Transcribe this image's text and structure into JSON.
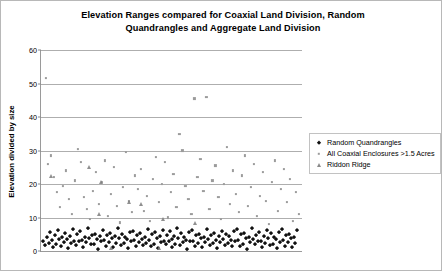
{
  "chart_data": {
    "type": "scatter",
    "title": "Elevation Ranges compared for Coaxial Land Division, Random Quandrangles and Aggregate Land Division",
    "title_line1": "Elevation Ranges compared for Coaxial Land Division, Random",
    "title_line2": "Quandrangles and Aggregate Land Division",
    "xlabel": "",
    "ylabel": "Elevation divided by size",
    "ylim": [
      0,
      60
    ],
    "yticks": [
      0,
      10,
      20,
      30,
      40,
      50,
      60
    ],
    "ytick_labels": [
      "0",
      "10",
      "20",
      "30",
      "40",
      "50",
      "60"
    ],
    "xlim": [
      0,
      262
    ],
    "xticks": [],
    "xtick_labels": [],
    "grid": "horizontal",
    "legend_position": "right",
    "series": [
      {
        "name": "Random Quandrangles",
        "marker": "diamond",
        "color": "#111111",
        "points": [
          [
            2,
            3.0
          ],
          [
            4,
            1.8
          ],
          [
            6,
            4.2
          ],
          [
            8,
            2.4
          ],
          [
            9,
            5.6
          ],
          [
            11,
            3.1
          ],
          [
            12,
            1.2
          ],
          [
            14,
            4.8
          ],
          [
            15,
            2.0
          ],
          [
            17,
            6.1
          ],
          [
            18,
            3.4
          ],
          [
            20,
            1.5
          ],
          [
            21,
            4.0
          ],
          [
            23,
            2.7
          ],
          [
            24,
            5.2
          ],
          [
            26,
            3.6
          ],
          [
            27,
            0.9
          ],
          [
            29,
            4.4
          ],
          [
            30,
            2.2
          ],
          [
            32,
            6.4
          ],
          [
            33,
            3.0
          ],
          [
            35,
            1.7
          ],
          [
            36,
            4.9
          ],
          [
            38,
            2.9
          ],
          [
            39,
            5.8
          ],
          [
            41,
            3.3
          ],
          [
            42,
            1.1
          ],
          [
            44,
            4.1
          ],
          [
            45,
            2.5
          ],
          [
            47,
            6.7
          ],
          [
            48,
            3.8
          ],
          [
            50,
            1.9
          ],
          [
            51,
            4.6
          ],
          [
            53,
            2.1
          ],
          [
            54,
            5.0
          ],
          [
            56,
            3.5
          ],
          [
            57,
            0.6
          ],
          [
            59,
            4.3
          ],
          [
            60,
            2.8
          ],
          [
            62,
            6.2
          ],
          [
            63,
            3.2
          ],
          [
            65,
            1.4
          ],
          [
            66,
            4.7
          ],
          [
            68,
            2.6
          ],
          [
            69,
            5.4
          ],
          [
            71,
            3.9
          ],
          [
            72,
            1.0
          ],
          [
            74,
            4.5
          ],
          [
            75,
            2.3
          ],
          [
            77,
            6.9
          ],
          [
            78,
            3.7
          ],
          [
            80,
            1.6
          ],
          [
            81,
            5.1
          ],
          [
            83,
            2.2
          ],
          [
            84,
            4.2
          ],
          [
            86,
            3.4
          ],
          [
            87,
            0.8
          ],
          [
            89,
            5.7
          ],
          [
            90,
            2.9
          ],
          [
            92,
            6.0
          ],
          [
            93,
            3.1
          ],
          [
            95,
            1.3
          ],
          [
            96,
            4.8
          ],
          [
            98,
            2.7
          ],
          [
            99,
            5.3
          ],
          [
            101,
            3.6
          ],
          [
            102,
            1.8
          ],
          [
            104,
            4.0
          ],
          [
            105,
            2.4
          ],
          [
            107,
            6.5
          ],
          [
            108,
            3.3
          ],
          [
            110,
            1.5
          ],
          [
            111,
            4.9
          ],
          [
            113,
            2.0
          ],
          [
            114,
            5.5
          ],
          [
            116,
            3.8
          ],
          [
            117,
            0.7
          ],
          [
            119,
            4.4
          ],
          [
            120,
            2.6
          ],
          [
            122,
            6.3
          ],
          [
            123,
            3.0
          ],
          [
            125,
            1.9
          ],
          [
            126,
            4.6
          ],
          [
            128,
            2.8
          ],
          [
            129,
            5.9
          ],
          [
            131,
            3.5
          ],
          [
            132,
            1.2
          ],
          [
            134,
            4.3
          ],
          [
            135,
            2.1
          ],
          [
            137,
            6.8
          ],
          [
            138,
            3.9
          ],
          [
            140,
            1.7
          ],
          [
            141,
            5.2
          ],
          [
            143,
            2.5
          ],
          [
            144,
            4.1
          ],
          [
            146,
            3.2
          ],
          [
            147,
            0.5
          ],
          [
            149,
            5.6
          ],
          [
            150,
            3.0
          ],
          [
            152,
            6.1
          ],
          [
            153,
            2.9
          ],
          [
            155,
            1.4
          ],
          [
            156,
            4.7
          ],
          [
            158,
            2.3
          ],
          [
            159,
            5.0
          ],
          [
            161,
            3.7
          ],
          [
            162,
            1.1
          ],
          [
            164,
            4.2
          ],
          [
            165,
            2.7
          ],
          [
            167,
            6.6
          ],
          [
            168,
            3.4
          ],
          [
            170,
            1.8
          ],
          [
            171,
            4.8
          ],
          [
            173,
            2.2
          ],
          [
            174,
            5.4
          ],
          [
            176,
            3.1
          ],
          [
            177,
            0.9
          ],
          [
            179,
            4.5
          ],
          [
            180,
            2.6
          ],
          [
            182,
            6.0
          ],
          [
            183,
            3.6
          ],
          [
            185,
            1.6
          ],
          [
            186,
            5.1
          ],
          [
            188,
            2.4
          ],
          [
            189,
            4.3
          ],
          [
            191,
            3.3
          ],
          [
            192,
            1.3
          ],
          [
            194,
            5.8
          ],
          [
            195,
            2.8
          ],
          [
            197,
            6.4
          ],
          [
            198,
            3.2
          ],
          [
            200,
            1.5
          ],
          [
            201,
            4.9
          ],
          [
            203,
            2.1
          ],
          [
            204,
            5.2
          ],
          [
            206,
            3.8
          ],
          [
            207,
            0.6
          ],
          [
            209,
            4.0
          ],
          [
            210,
            2.5
          ],
          [
            212,
            6.7
          ],
          [
            213,
            3.5
          ],
          [
            215,
            1.9
          ],
          [
            216,
            4.6
          ],
          [
            218,
            2.9
          ],
          [
            219,
            5.5
          ],
          [
            221,
            3.0
          ],
          [
            222,
            1.0
          ],
          [
            224,
            4.4
          ],
          [
            225,
            2.3
          ],
          [
            227,
            6.2
          ],
          [
            228,
            3.7
          ],
          [
            230,
            1.7
          ],
          [
            231,
            5.3
          ],
          [
            233,
            2.0
          ],
          [
            234,
            4.1
          ],
          [
            236,
            3.4
          ],
          [
            237,
            0.8
          ],
          [
            239,
            5.7
          ],
          [
            240,
            2.7
          ],
          [
            242,
            6.5
          ],
          [
            243,
            3.1
          ],
          [
            245,
            1.4
          ],
          [
            246,
            4.8
          ],
          [
            248,
            2.6
          ],
          [
            249,
            5.0
          ],
          [
            251,
            3.9
          ],
          [
            252,
            1.2
          ],
          [
            254,
            4.2
          ],
          [
            255,
            2.2
          ],
          [
            257,
            6.1
          ]
        ]
      },
      {
        "name": "All Coaxial Enclosures >1.5 Acres",
        "marker": "square",
        "color": "#9b9b9b",
        "points": [
          [
            5,
            51.5
          ],
          [
            7,
            26.0
          ],
          [
            10,
            28.5
          ],
          [
            13,
            22.0
          ],
          [
            16,
            17.5
          ],
          [
            19,
            13.0
          ],
          [
            22,
            19.5
          ],
          [
            25,
            24.0
          ],
          [
            28,
            15.5
          ],
          [
            31,
            11.0
          ],
          [
            34,
            21.0
          ],
          [
            37,
            30.5
          ],
          [
            40,
            26.5
          ],
          [
            43,
            16.0
          ],
          [
            46,
            12.5
          ],
          [
            49,
            9.5
          ],
          [
            52,
            18.0
          ],
          [
            55,
            23.5
          ],
          [
            58,
            14.0
          ],
          [
            61,
            20.5
          ],
          [
            64,
            27.0
          ],
          [
            67,
            10.5
          ],
          [
            70,
            17.0
          ],
          [
            73,
            25.0
          ],
          [
            76,
            13.5
          ],
          [
            79,
            8.5
          ],
          [
            82,
            19.0
          ],
          [
            85,
            29.5
          ],
          [
            88,
            15.0
          ],
          [
            91,
            11.5
          ],
          [
            94,
            22.5
          ],
          [
            97,
            18.5
          ],
          [
            100,
            24.5
          ],
          [
            103,
            12.0
          ],
          [
            106,
            16.5
          ],
          [
            109,
            9.0
          ],
          [
            112,
            21.5
          ],
          [
            115,
            28.0
          ],
          [
            118,
            14.5
          ],
          [
            121,
            20.0
          ],
          [
            124,
            26.5
          ],
          [
            127,
            10.0
          ],
          [
            130,
            17.5
          ],
          [
            133,
            23.0
          ],
          [
            136,
            13.0
          ],
          [
            139,
            35.0
          ],
          [
            142,
            30.0
          ],
          [
            145,
            19.5
          ],
          [
            148,
            15.5
          ],
          [
            151,
            11.0
          ],
          [
            154,
            45.5
          ],
          [
            157,
            22.0
          ],
          [
            160,
            27.5
          ],
          [
            163,
            18.0
          ],
          [
            166,
            46.0
          ],
          [
            169,
            12.5
          ],
          [
            172,
            21.0
          ],
          [
            175,
            25.5
          ],
          [
            178,
            16.0
          ],
          [
            181,
            9.5
          ],
          [
            184,
            20.0
          ],
          [
            187,
            31.0
          ],
          [
            190,
            14.0
          ],
          [
            193,
            24.0
          ],
          [
            196,
            17.0
          ],
          [
            199,
            11.5
          ],
          [
            202,
            22.5
          ],
          [
            205,
            28.5
          ],
          [
            208,
            13.5
          ],
          [
            211,
            19.0
          ],
          [
            214,
            26.0
          ],
          [
            217,
            10.5
          ],
          [
            220,
            16.5
          ],
          [
            223,
            23.5
          ],
          [
            226,
            15.0
          ],
          [
            229,
            8.0
          ],
          [
            232,
            20.5
          ],
          [
            235,
            27.0
          ],
          [
            238,
            12.0
          ],
          [
            241,
            18.5
          ],
          [
            244,
            24.5
          ],
          [
            247,
            14.5
          ],
          [
            250,
            21.5
          ],
          [
            253,
            9.0
          ],
          [
            256,
            17.5
          ],
          [
            259,
            11.0
          ]
        ]
      },
      {
        "name": "Riddon Ridge",
        "marker": "triangle",
        "color": "#7d7d7d",
        "points": [
          [
            10,
            22.5
          ],
          [
            48,
            25.0
          ],
          [
            60,
            20.5
          ],
          [
            88,
            14.5
          ],
          [
            100,
            14.0
          ],
          [
            58,
            11.0
          ],
          [
            122,
            9.5
          ],
          [
            155,
            8.5
          ],
          [
            70,
            1.0
          ],
          [
            118,
            0.8
          ]
        ]
      }
    ]
  },
  "legend": {
    "entries": [
      {
        "label": "Random Quandrangles"
      },
      {
        "label": "All Coaxial Enclosures >1.5 Acres"
      },
      {
        "label": "Riddon Ridge"
      }
    ]
  }
}
